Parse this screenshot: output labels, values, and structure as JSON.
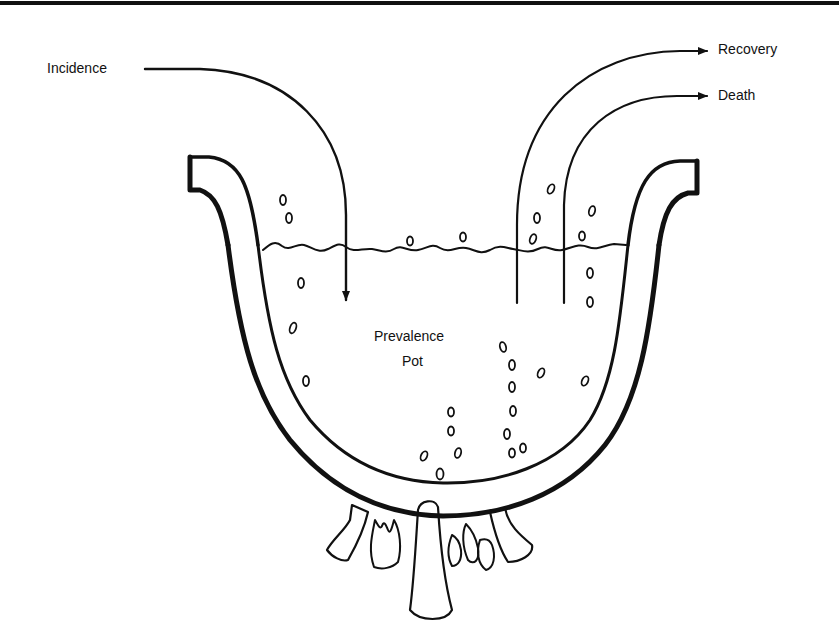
{
  "diagram": {
    "title": "Prevalence Pot",
    "labels": {
      "incidence": "Incidence",
      "recovery": "Recovery",
      "death": "Death",
      "pot_line1": "Prevalence",
      "pot_line2": "Pot"
    },
    "flows": [
      {
        "name": "Incidence",
        "direction": "into pot"
      },
      {
        "name": "Recovery",
        "direction": "out of pot"
      },
      {
        "name": "Death",
        "direction": "out of pot"
      }
    ],
    "colors": {
      "ink": "#111111",
      "background": "#ffffff"
    }
  }
}
